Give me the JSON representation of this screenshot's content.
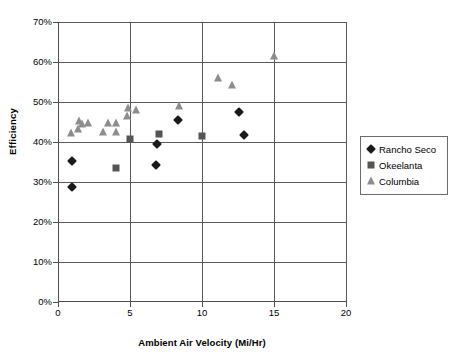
{
  "chart_data": {
    "type": "scatter",
    "title": "",
    "xlabel": "Ambient Air Velocity (Mi/Hr)",
    "ylabel": "Efficiency",
    "xlim": [
      0,
      20
    ],
    "ylim": [
      0,
      0.7
    ],
    "xticks": [
      "0",
      "5",
      "10",
      "15",
      "20"
    ],
    "xtick_values": [
      0,
      5,
      10,
      15,
      20
    ],
    "yticks": [
      "0%",
      "10%",
      "20%",
      "30%",
      "40%",
      "50%",
      "60%",
      "70%"
    ],
    "ytick_values": [
      0,
      0.1,
      0.2,
      0.3,
      0.4,
      0.5,
      0.6,
      0.7
    ],
    "grid": "both",
    "legend_position": "right",
    "series": [
      {
        "name": "Rancho Seco",
        "marker": "diamond",
        "color": "#1a1a1a",
        "points": [
          {
            "x": 1.0,
            "y": 0.353
          },
          {
            "x": 1.0,
            "y": 0.288
          },
          {
            "x": 6.8,
            "y": 0.342
          },
          {
            "x": 6.9,
            "y": 0.396
          },
          {
            "x": 8.3,
            "y": 0.455
          },
          {
            "x": 12.6,
            "y": 0.475
          },
          {
            "x": 12.9,
            "y": 0.418
          }
        ]
      },
      {
        "name": "Okeelanta",
        "marker": "square",
        "color": "#555555",
        "points": [
          {
            "x": 4.0,
            "y": 0.335
          },
          {
            "x": 5.0,
            "y": 0.408
          },
          {
            "x": 7.0,
            "y": 0.419
          },
          {
            "x": 10.0,
            "y": 0.415
          }
        ]
      },
      {
        "name": "Columbia",
        "marker": "triangle",
        "color": "#8d8d8d",
        "points": [
          {
            "x": 0.9,
            "y": 0.423
          },
          {
            "x": 1.4,
            "y": 0.432
          },
          {
            "x": 1.45,
            "y": 0.452
          },
          {
            "x": 1.7,
            "y": 0.445
          },
          {
            "x": 2.1,
            "y": 0.448
          },
          {
            "x": 3.1,
            "y": 0.424
          },
          {
            "x": 3.5,
            "y": 0.447
          },
          {
            "x": 4.0,
            "y": 0.424
          },
          {
            "x": 4.05,
            "y": 0.448
          },
          {
            "x": 4.8,
            "y": 0.466
          },
          {
            "x": 4.85,
            "y": 0.486
          },
          {
            "x": 5.4,
            "y": 0.48
          },
          {
            "x": 8.4,
            "y": 0.489
          },
          {
            "x": 11.1,
            "y": 0.561
          },
          {
            "x": 12.1,
            "y": 0.543
          },
          {
            "x": 15.0,
            "y": 0.615
          }
        ]
      }
    ]
  }
}
